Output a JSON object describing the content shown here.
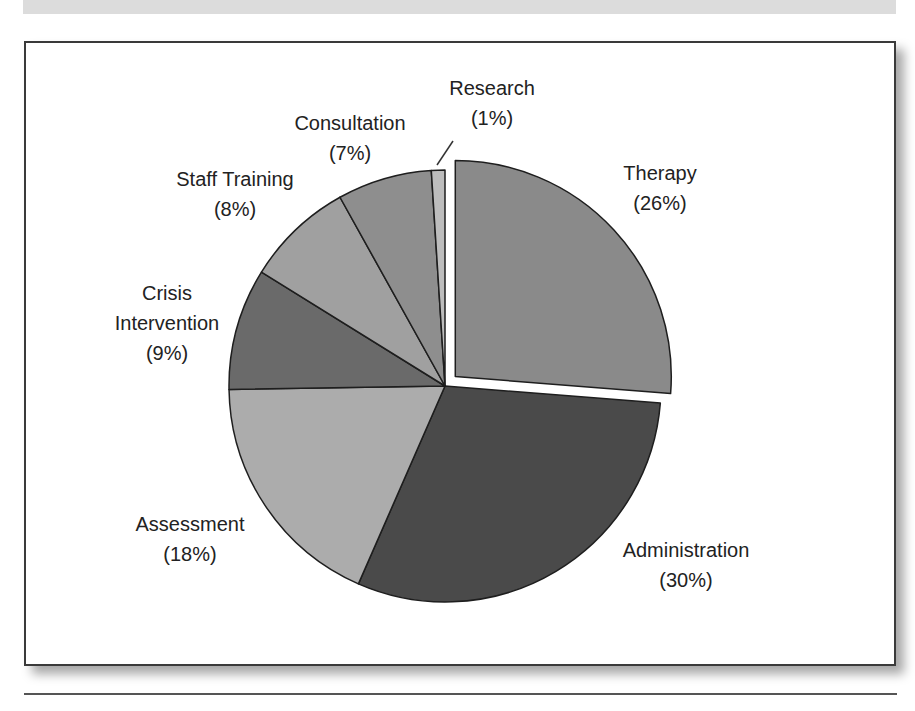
{
  "chart_data": {
    "type": "pie",
    "title": "",
    "start_angle_deg": 0,
    "direction": "clockwise",
    "exploded": [
      "Therapy"
    ],
    "categories": [
      "Therapy",
      "Administration",
      "Assessment",
      "Crisis Intervention",
      "Staff Training",
      "Consultation",
      "Research"
    ],
    "values": [
      26,
      30,
      18,
      9,
      8,
      7,
      1
    ],
    "slices": [
      {
        "label": "Therapy",
        "value": 26,
        "display": "(26%)",
        "color": "#8a8a8a"
      },
      {
        "label": "Administration",
        "value": 30,
        "display": "(30%)",
        "color": "#4a4a4a"
      },
      {
        "label": "Assessment",
        "value": 18,
        "display": "(18%)",
        "color": "#acacac"
      },
      {
        "label": "Crisis Intervention",
        "value": 9,
        "display": "(9%)",
        "color": "#6a6a6a"
      },
      {
        "label": "Staff Training",
        "value": 8,
        "display": "(8%)",
        "color": "#a0a0a0"
      },
      {
        "label": "Consultation",
        "value": 7,
        "display": "(7%)",
        "color": "#8e8e8e"
      },
      {
        "label": "Research",
        "value": 1,
        "display": "(1%)",
        "color": "#bdbdbd"
      }
    ],
    "legend": "none (direct labels)",
    "grid": false
  },
  "labels": {
    "therapy": {
      "name": "Therapy",
      "pct": "(26%)"
    },
    "administration": {
      "name": "Administration",
      "pct": "(30%)"
    },
    "assessment": {
      "name": "Assessment",
      "pct": "(18%)"
    },
    "crisis": {
      "name1": "Crisis",
      "name2": "Intervention",
      "pct": "(9%)"
    },
    "staff": {
      "name": "Staff Training",
      "pct": "(8%)"
    },
    "consultation": {
      "name": "Consultation",
      "pct": "(7%)"
    },
    "research": {
      "name": "Research",
      "pct": "(1%)"
    }
  }
}
